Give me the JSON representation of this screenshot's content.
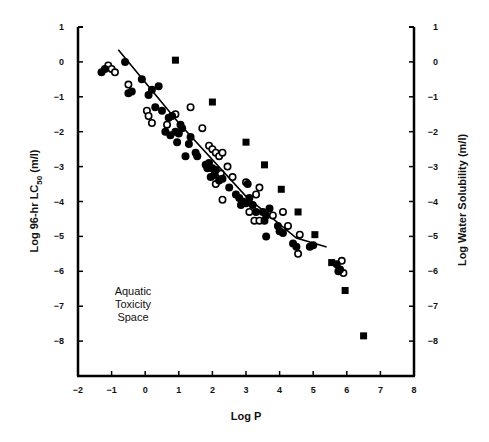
{
  "chart_data": {
    "type": "scatter",
    "title": "",
    "xlabel": "Log P",
    "ylabel": "Log 96-hr LC50 (m/l)",
    "ylabel_parts": {
      "main": "Log 96-hr LC",
      "sub": "50",
      "suffix": " (m/l)"
    },
    "y2label": "Log Water Solubility (m/l)",
    "xlim": [
      -2,
      8
    ],
    "ylim": [
      -9,
      1
    ],
    "y2lim": [
      -9,
      1
    ],
    "x_ticks": [
      "-2",
      "-1",
      "0",
      "1",
      "2",
      "3",
      "4",
      "5",
      "6",
      "7",
      "8"
    ],
    "y_ticks": [
      "1",
      "0",
      "-1",
      "-2",
      "-3",
      "-4",
      "-5",
      "-6",
      "-7",
      "-8"
    ],
    "y2_ticks": [
      "1",
      "0",
      "-1",
      "-2",
      "-3",
      "-4",
      "-5",
      "-6",
      "-7",
      "-8"
    ],
    "grid": false,
    "legend": null,
    "annotations": [
      {
        "text": [
          "Aquatic",
          "Toxicity",
          "Space"
        ],
        "x": -0.8,
        "y": -6.4
      }
    ],
    "series": [
      {
        "name": "Toxicity (filled circles)",
        "marker": "filled-circle",
        "points": [
          [
            -1.3,
            -0.3
          ],
          [
            -1.2,
            -0.2
          ],
          [
            -0.6,
            0.0
          ],
          [
            -0.5,
            -0.9
          ],
          [
            -0.4,
            -0.85
          ],
          [
            -0.1,
            -0.5
          ],
          [
            0.1,
            -0.95
          ],
          [
            0.2,
            -0.8
          ],
          [
            0.4,
            -0.7
          ],
          [
            0.3,
            -1.3
          ],
          [
            0.5,
            -1.4
          ],
          [
            0.7,
            -1.6
          ],
          [
            0.8,
            -1.55
          ],
          [
            0.6,
            -2.0
          ],
          [
            0.75,
            -2.1
          ],
          [
            0.9,
            -2.0
          ],
          [
            1.0,
            -2.05
          ],
          [
            1.05,
            -1.8
          ],
          [
            1.1,
            -1.9
          ],
          [
            0.95,
            -2.3
          ],
          [
            1.3,
            -2.35
          ],
          [
            1.5,
            -2.6
          ],
          [
            1.55,
            -2.7
          ],
          [
            1.2,
            -2.7
          ],
          [
            1.35,
            -2.15
          ],
          [
            1.8,
            -2.95
          ],
          [
            1.85,
            -3.05
          ],
          [
            1.9,
            -2.9
          ],
          [
            2.0,
            -3.05
          ],
          [
            2.1,
            -3.1
          ],
          [
            2.05,
            -3.25
          ],
          [
            1.95,
            -3.3
          ],
          [
            2.2,
            -3.4
          ],
          [
            2.3,
            -3.35
          ],
          [
            2.5,
            -3.6
          ],
          [
            2.7,
            -3.8
          ],
          [
            2.8,
            -3.9
          ],
          [
            2.9,
            -4.0
          ],
          [
            3.0,
            -4.05
          ],
          [
            3.1,
            -3.9
          ],
          [
            3.2,
            -4.1
          ],
          [
            2.85,
            -4.1
          ],
          [
            3.05,
            -3.5
          ],
          [
            3.3,
            -4.3
          ],
          [
            3.5,
            -4.3
          ],
          [
            3.6,
            -4.4
          ],
          [
            3.7,
            -4.2
          ],
          [
            3.55,
            -4.55
          ],
          [
            3.95,
            -4.7
          ],
          [
            4.0,
            -4.85
          ],
          [
            4.1,
            -4.9
          ],
          [
            3.6,
            -5.0
          ],
          [
            4.4,
            -5.2
          ],
          [
            4.5,
            -5.3
          ],
          [
            4.9,
            -5.3
          ],
          [
            5.0,
            -5.25
          ],
          [
            5.7,
            -5.8
          ],
          [
            5.75,
            -6.0
          ],
          [
            5.8,
            -5.95
          ]
        ]
      },
      {
        "name": "Toxicity (open circles)",
        "marker": "open-circle",
        "points": [
          [
            -1.1,
            -0.1
          ],
          [
            -1.0,
            -0.2
          ],
          [
            -0.9,
            -0.3
          ],
          [
            -0.5,
            -0.65
          ],
          [
            0.05,
            -1.4
          ],
          [
            0.1,
            -1.55
          ],
          [
            0.2,
            -1.75
          ],
          [
            0.65,
            -1.8
          ],
          [
            0.9,
            -1.5
          ],
          [
            1.35,
            -1.3
          ],
          [
            1.7,
            -1.9
          ],
          [
            1.9,
            -2.4
          ],
          [
            2.0,
            -2.5
          ],
          [
            2.1,
            -2.6
          ],
          [
            2.2,
            -2.7
          ],
          [
            2.3,
            -2.6
          ],
          [
            2.25,
            -3.2
          ],
          [
            2.45,
            -3.0
          ],
          [
            2.6,
            -3.3
          ],
          [
            2.1,
            -3.5
          ],
          [
            2.3,
            -3.95
          ],
          [
            3.0,
            -3.45
          ],
          [
            3.4,
            -3.6
          ],
          [
            3.3,
            -3.8
          ],
          [
            3.1,
            -4.3
          ],
          [
            3.25,
            -4.55
          ],
          [
            3.4,
            -4.55
          ],
          [
            3.8,
            -4.4
          ],
          [
            4.1,
            -4.3
          ],
          [
            4.25,
            -4.7
          ],
          [
            4.6,
            -4.95
          ],
          [
            4.55,
            -5.5
          ],
          [
            5.85,
            -5.7
          ],
          [
            5.9,
            -6.05
          ]
        ]
      },
      {
        "name": "Water solubility (filled squares)",
        "marker": "filled-square",
        "points": [
          [
            0.9,
            0.05
          ],
          [
            2.0,
            -1.15
          ],
          [
            3.0,
            -2.3
          ],
          [
            3.55,
            -2.95
          ],
          [
            4.05,
            -3.65
          ],
          [
            4.55,
            -4.3
          ],
          [
            5.05,
            -4.95
          ],
          [
            5.55,
            -5.75
          ],
          [
            5.95,
            -6.55
          ],
          [
            6.5,
            -7.85
          ]
        ]
      },
      {
        "name": "Regression line",
        "marker": "line",
        "points": [
          [
            -0.8,
            0.35
          ],
          [
            1.0,
            -1.75
          ],
          [
            3.0,
            -3.85
          ],
          [
            4.5,
            -5.05
          ],
          [
            5.4,
            -5.3
          ]
        ]
      }
    ]
  },
  "axes": {
    "x_label": "Log P",
    "y_label_main": "Log 96-hr LC",
    "y_label_sub": "50",
    "y_label_suffix": " (m/l)",
    "y2_label": "Log Water Solubility (m/l)"
  },
  "annotation": {
    "line1": "Aquatic",
    "line2": "Toxicity",
    "line3": "Space"
  }
}
